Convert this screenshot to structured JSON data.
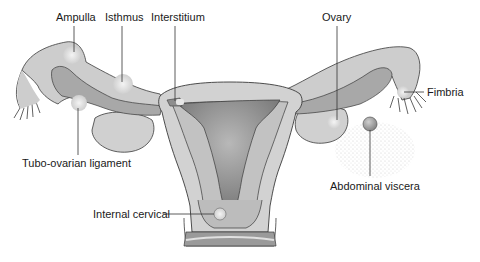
{
  "diagram": {
    "labels": {
      "ampulla": "Ampulla",
      "isthmus": "Isthmus",
      "interstitium": "Interstitium",
      "ovary": "Ovary",
      "fimbria": "Fimbria",
      "tubo_ovarian_ligament": "Tubo-ovarian ligament",
      "abdominal_viscera": "Abdominal viscera",
      "internal_cervical": "Internal cervical"
    },
    "colors": {
      "outline": "#3a3a3a",
      "tissue_light": "#d4d4d4",
      "tissue_mid": "#b4b4b4",
      "tissue_dark": "#8c8c8c",
      "cavity": "#7a7a7a",
      "highlight": "#eeeeee",
      "leader": "#333333"
    }
  }
}
